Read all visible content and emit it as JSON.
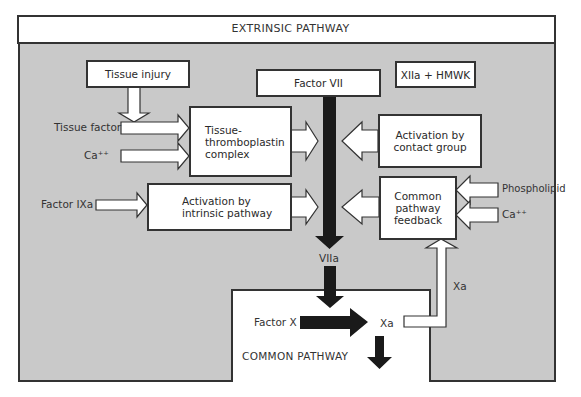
{
  "diagram": {
    "title": "EXTRINSIC PATHWAY",
    "common_pathway_title": "COMMON PATHWAY",
    "colors": {
      "background_region": "#c9c9c9",
      "box_fill": "#ffffff",
      "border": "#333333",
      "thick_arrow": "#1a1a1a"
    },
    "boxes": {
      "tissue_injury": "Tissue injury",
      "factor_vii": "Factor VII",
      "xiia_hmwk": "XIIa + HMWK",
      "tissue_thromboplastin_line1": "Tissue-",
      "tissue_thromboplastin_line2": "thromboplastin",
      "tissue_thromboplastin_line3": "complex",
      "contact_group_line1": "Activation by",
      "contact_group_line2": "contact group",
      "intrinsic_line1": "Activation by",
      "intrinsic_line2": "intrinsic pathway",
      "feedback_line1": "Common",
      "feedback_line2": "pathway",
      "feedback_line3": "feedback"
    },
    "labels": {
      "tissue_factor": "Tissue factor",
      "ca_left": "Ca⁺⁺",
      "factor_ixa": "Factor IXa",
      "phospholipid": "Phospholipid",
      "ca_right": "Ca⁺⁺",
      "viia": "VIIa",
      "factor_x": "Factor X",
      "xa_product": "Xa",
      "xa_feedback": "Xa"
    }
  }
}
